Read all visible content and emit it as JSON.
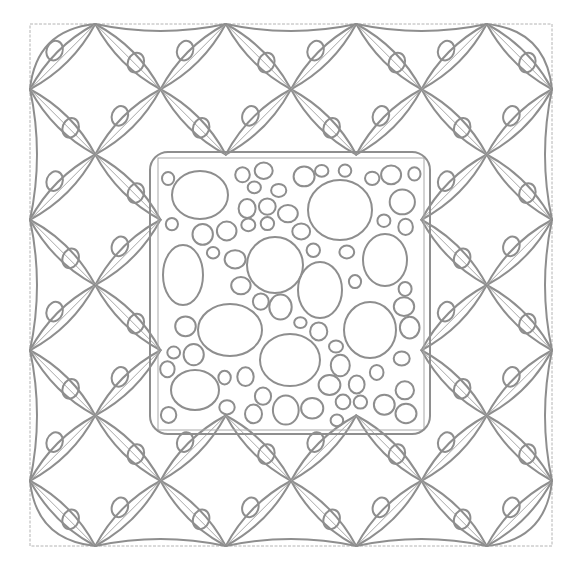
{
  "figure": {
    "colors": {
      "line": "#8e8e8e",
      "guide": "#b4b4b4",
      "background": "#ffffff"
    },
    "outer_square": {
      "x": 30,
      "y": 24,
      "size": 522
    },
    "grid_pitch": 125,
    "inner_square": {
      "x": 158,
      "y": 158,
      "w": 266,
      "h": 272
    },
    "big_pebbles": [
      [
        200,
        195,
        28,
        24
      ],
      [
        340,
        210,
        32,
        30
      ],
      [
        385,
        260,
        22,
        26
      ],
      [
        183,
        275,
        20,
        30
      ],
      [
        275,
        265,
        28,
        28
      ],
      [
        320,
        290,
        22,
        28
      ],
      [
        230,
        330,
        32,
        26
      ],
      [
        370,
        330,
        26,
        28
      ],
      [
        290,
        360,
        30,
        26
      ],
      [
        195,
        390,
        24,
        20
      ]
    ]
  }
}
